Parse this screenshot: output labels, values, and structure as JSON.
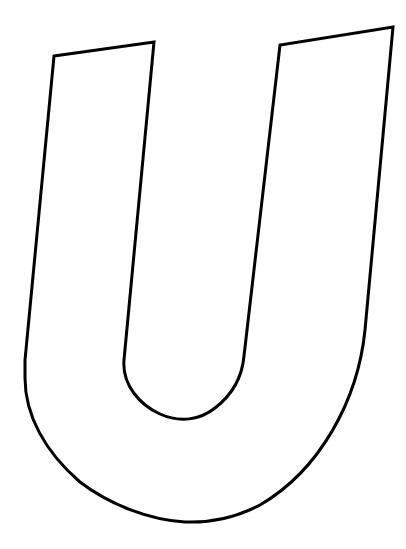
{
  "image": {
    "subject": "Outlined letter U",
    "letter": "U",
    "background_color": "#ffffff",
    "stroke_color": "#000000",
    "fill_color": "#ffffff",
    "stroke_width": 3
  }
}
